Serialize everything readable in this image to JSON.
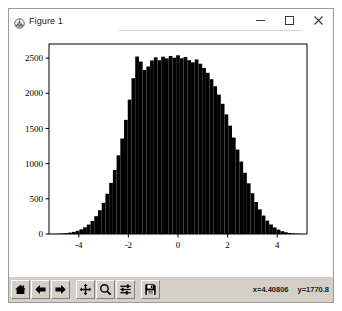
{
  "window": {
    "title": "Figure 1",
    "icon": "matplotlib-logo-icon",
    "controls": {
      "minimize_label": "Minimize",
      "maximize_label": "Maximize",
      "close_label": "Close"
    }
  },
  "toolbar": {
    "buttons": [
      {
        "name": "home",
        "label": "Reset original view"
      },
      {
        "name": "back",
        "label": "Back to previous view"
      },
      {
        "name": "forward",
        "label": "Forward to next view"
      },
      {
        "name": "pan",
        "label": "Pan axes with left mouse, zoom with right"
      },
      {
        "name": "zoom",
        "label": "Zoom to rectangle"
      },
      {
        "name": "configure-subplots",
        "label": "Configure subplots"
      },
      {
        "name": "save",
        "label": "Save the figure"
      }
    ],
    "coordinates": {
      "x": "x=4.40806",
      "y": "y=1770.8"
    }
  },
  "chart_data": {
    "type": "bar",
    "title": "",
    "xlabel": "",
    "ylabel": "",
    "xlim": [
      -5.2,
      5.2
    ],
    "ylim": [
      0,
      2700
    ],
    "xticks": [
      -4,
      -2,
      0,
      2,
      4
    ],
    "yticks": [
      0,
      500,
      1000,
      1500,
      2000,
      2500
    ],
    "xtick_labels": [
      "-4",
      "-2",
      "0",
      "2",
      "4"
    ],
    "ytick_labels": [
      "0",
      "500",
      "1000",
      "1500",
      "2000",
      "2500"
    ],
    "grid": false,
    "legend": null,
    "bar_color": "#000000",
    "distribution": "normal",
    "mean": 0,
    "std": 1,
    "peak_value": 2500,
    "x": [
      -5.1,
      -4.95,
      -4.8,
      -4.65,
      -4.5,
      -4.35,
      -4.2,
      -4.05,
      -3.9,
      -3.75,
      -3.6,
      -3.45,
      -3.3,
      -3.15,
      -3.0,
      -2.85,
      -2.7,
      -2.55,
      -2.4,
      -2.25,
      -2.1,
      -1.95,
      -1.8,
      -1.65,
      -1.5,
      -1.35,
      -1.2,
      -1.05,
      -0.9,
      -0.75,
      -0.6,
      -0.45,
      -0.3,
      -0.15,
      0.0,
      0.15,
      0.3,
      0.45,
      0.6,
      0.75,
      0.9,
      1.05,
      1.2,
      1.35,
      1.5,
      1.65,
      1.8,
      1.95,
      2.1,
      2.25,
      2.4,
      2.55,
      2.7,
      2.85,
      3.0,
      3.15,
      3.3,
      3.45,
      3.6,
      3.75,
      3.9,
      4.05,
      4.2,
      4.35,
      4.5,
      4.65,
      4.8,
      4.95
    ],
    "values": [
      2,
      3,
      5,
      8,
      13,
      20,
      30,
      45,
      66,
      95,
      134,
      186,
      253,
      338,
      443,
      572,
      726,
      908,
      1118,
      1357,
      1622,
      1910,
      2214,
      2522,
      2450,
      2330,
      2380,
      2466,
      2510,
      2470,
      2520,
      2495,
      2530,
      2505,
      2540,
      2498,
      2515,
      2470,
      2440,
      2480,
      2420,
      2360,
      2290,
      2200,
      2100,
      1980,
      1850,
      1700,
      1540,
      1370,
      1200,
      1030,
      870,
      720,
      580,
      455,
      350,
      262,
      190,
      135,
      93,
      62,
      40,
      25,
      15,
      9,
      5,
      3
    ]
  }
}
